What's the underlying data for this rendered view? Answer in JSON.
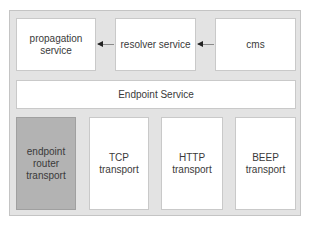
{
  "diagram": {
    "top_row": [
      {
        "label": "propagation\nservice"
      },
      {
        "label": "resolver service"
      },
      {
        "label": "cms"
      }
    ],
    "arrows": [
      {
        "from": "cms",
        "to": "resolver service"
      },
      {
        "from": "resolver service",
        "to": "propagation service"
      }
    ],
    "middle": {
      "label": "Endpoint Service"
    },
    "bottom_row": [
      {
        "label": "endpoint\nrouter\ntransport",
        "highlighted": true
      },
      {
        "label": "TCP\ntransport"
      },
      {
        "label": "HTTP\ntransport"
      },
      {
        "label": "BEEP\ntransport"
      }
    ],
    "colors": {
      "container_bg": "#e3e3e3",
      "box_bg": "#ffffff",
      "highlight_bg": "#b3b3b3",
      "arrow": "#222222"
    }
  }
}
